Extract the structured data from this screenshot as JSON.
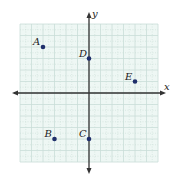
{
  "diagram": {
    "type": "coordinate-plane",
    "axes": {
      "x_label": "x",
      "y_label": "y",
      "x_range": [
        -6,
        6
      ],
      "y_range": [
        -6,
        6
      ],
      "grid": true,
      "minor_grid": "dotted"
    },
    "points": [
      {
        "label": "A",
        "x": -4,
        "y": 4
      },
      {
        "label": "B",
        "x": -3,
        "y": -4
      },
      {
        "label": "C",
        "x": 0,
        "y": -4
      },
      {
        "label": "D",
        "x": 0,
        "y": 3
      },
      {
        "label": "E",
        "x": 4,
        "y": 1
      }
    ],
    "colors": {
      "grid_background": "#eef7f4",
      "grid_line": "#c9ddd8",
      "axis": "#333333",
      "point": "#1f2f6b"
    }
  }
}
